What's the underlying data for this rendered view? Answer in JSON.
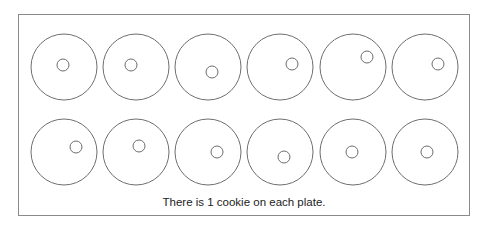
{
  "caption": "There is 1 cookie on each plate.",
  "colors": {
    "stroke": "#6e6e6e",
    "border": "#8a8a8a",
    "text": "#222222"
  },
  "plate_radius": 33,
  "cookie_radius": 6,
  "plates": [
    {
      "cx": 64,
      "cy": 67,
      "cookie": {
        "cx": 63,
        "cy": 65
      }
    },
    {
      "cx": 136,
      "cy": 67,
      "cookie": {
        "cx": 131,
        "cy": 65
      }
    },
    {
      "cx": 208,
      "cy": 67,
      "cookie": {
        "cx": 212,
        "cy": 72
      }
    },
    {
      "cx": 280,
      "cy": 67,
      "cookie": {
        "cx": 292,
        "cy": 64
      }
    },
    {
      "cx": 353,
      "cy": 67,
      "cookie": {
        "cx": 367,
        "cy": 57
      }
    },
    {
      "cx": 425,
      "cy": 67,
      "cookie": {
        "cx": 438,
        "cy": 64
      }
    },
    {
      "cx": 64,
      "cy": 152,
      "cookie": {
        "cx": 76,
        "cy": 147
      }
    },
    {
      "cx": 136,
      "cy": 152,
      "cookie": {
        "cx": 139,
        "cy": 146
      }
    },
    {
      "cx": 208,
      "cy": 152,
      "cookie": {
        "cx": 217,
        "cy": 152
      }
    },
    {
      "cx": 280,
      "cy": 152,
      "cookie": {
        "cx": 284,
        "cy": 157
      }
    },
    {
      "cx": 353,
      "cy": 152,
      "cookie": {
        "cx": 352,
        "cy": 152
      }
    },
    {
      "cx": 425,
      "cy": 152,
      "cookie": {
        "cx": 427,
        "cy": 152
      }
    }
  ]
}
